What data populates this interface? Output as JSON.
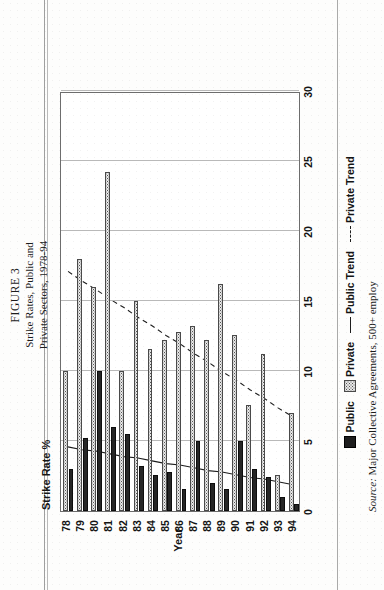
{
  "figure": {
    "label": "FIGURE 3",
    "title_line1": "Strike Rates, Public and",
    "title_line2": "Private Sectors, 1978-94"
  },
  "source": {
    "prefix": "Source:",
    "text": "Major Collective Agreements, 500+ employ"
  },
  "legend": {
    "public": "Public",
    "private": "Private",
    "public_trend": "Public Trend",
    "private_trend": "Private Trend"
  },
  "axes": {
    "y_caption": "Strike Rate %",
    "x_title": "Year",
    "y_ticks": [
      "0",
      "5",
      "10",
      "15",
      "20",
      "25",
      "30"
    ],
    "x_ticks": [
      "78",
      "79",
      "80",
      "81",
      "82",
      "83",
      "84",
      "85",
      "86",
      "87",
      "88",
      "89",
      "90",
      "91",
      "92",
      "93",
      "94"
    ]
  },
  "colors": {
    "public": "#262626",
    "private": "#e8e8e8",
    "axis": "#6d6d6d",
    "grid": "#b9b9b9",
    "text": "#141414"
  },
  "chart_data": {
    "type": "bar",
    "title": "Strike Rates, Public and Private Sectors, 1978-94",
    "xlabel": "Year",
    "ylabel": "Strike Rate %",
    "ylim": [
      0,
      30
    ],
    "grid": true,
    "legend_position": "bottom",
    "categories": [
      "78",
      "79",
      "80",
      "81",
      "82",
      "83",
      "84",
      "85",
      "86",
      "87",
      "88",
      "89",
      "90",
      "91",
      "92",
      "93",
      "94"
    ],
    "series": [
      {
        "name": "Public",
        "type": "bar",
        "values": [
          3.0,
          5.2,
          10.0,
          6.0,
          5.5,
          3.2,
          2.6,
          2.8,
          1.6,
          5.0,
          2.0,
          1.6,
          5.0,
          3.0,
          2.4,
          1.0,
          0.5
        ]
      },
      {
        "name": "Private",
        "type": "bar",
        "values": [
          10.0,
          18.0,
          16.0,
          24.2,
          10.0,
          15.0,
          11.6,
          12.2,
          12.8,
          13.2,
          12.2,
          16.2,
          12.6,
          7.6,
          11.2,
          2.6,
          7.0
        ]
      },
      {
        "name": "Public Trend",
        "type": "line",
        "style": "solid",
        "values": [
          4.6,
          4.4,
          4.3,
          4.1,
          3.9,
          3.8,
          3.6,
          3.4,
          3.3,
          3.1,
          2.9,
          2.8,
          2.6,
          2.4,
          2.3,
          2.1,
          1.9
        ]
      },
      {
        "name": "Private Trend",
        "type": "line",
        "style": "dashed",
        "values": [
          17.2,
          16.5,
          15.9,
          15.2,
          14.6,
          13.9,
          13.3,
          12.6,
          12.0,
          11.3,
          10.7,
          10.0,
          9.4,
          8.7,
          8.1,
          7.4,
          6.8
        ]
      }
    ]
  }
}
